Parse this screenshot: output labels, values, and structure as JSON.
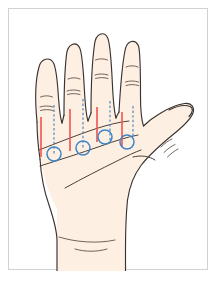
{
  "figure": {
    "frame_border_color": "#d2d2d2",
    "background_color": "#ffffff"
  },
  "colors": {
    "skin_fill": "#FDF0E3",
    "outline": "#3a3230",
    "crease": "#5a4a42",
    "measurement_line": "#ef5350",
    "guide_line": "#4a86c8",
    "marker": "#3f86c6"
  },
  "hand": {
    "view": "palmar",
    "side": "right",
    "parts": [
      {
        "name": "index-finger",
        "label": "Index finger"
      },
      {
        "name": "middle-finger",
        "label": "Middle finger"
      },
      {
        "name": "ring-finger",
        "label": "Ring finger"
      },
      {
        "name": "little-finger",
        "label": "Little finger"
      },
      {
        "name": "thumb",
        "label": "Thumb"
      },
      {
        "name": "palm",
        "label": "Palm"
      },
      {
        "name": "wrist",
        "label": "Wrist"
      }
    ]
  },
  "annotations": {
    "measurement_lines": {
      "count": 4,
      "style": "solid",
      "color": "#ef5350",
      "description": "Vertical red measurement lines over the distal palm"
    },
    "guide_lines": {
      "count": 4,
      "style": "dashed",
      "color": "#4a86c8",
      "description": "Vertical blue dashed guide lines in the web spaces"
    },
    "markers": {
      "count": 4,
      "shape": "circle",
      "color": "#3f86c6",
      "description": "Blue circle landmarks on the distal palmar crease"
    }
  },
  "chart_data": {
    "type": "scatter",
    "xlabel": "",
    "ylabel": "",
    "series": [
      {
        "name": "measurement-lines-red",
        "points": [
          {
            "x": 32,
            "y1": 108,
            "y2": 148
          },
          {
            "x": 61,
            "y1": 100,
            "y2": 142
          },
          {
            "x": 88,
            "y1": 98,
            "y2": 133
          },
          {
            "x": 113,
            "y1": 103,
            "y2": 138
          }
        ]
      },
      {
        "name": "guide-lines-blue-dashed",
        "points": [
          {
            "x": 45,
            "y1": 96,
            "y2": 146
          },
          {
            "x": 74,
            "y1": 90,
            "y2": 140
          },
          {
            "x": 101,
            "y1": 92,
            "y2": 134
          },
          {
            "x": 124,
            "y1": 97,
            "y2": 130
          }
        ]
      },
      {
        "name": "markers-blue-circles",
        "points": [
          {
            "x": 45,
            "y": 145,
            "r": 7
          },
          {
            "x": 74,
            "y": 139,
            "r": 7
          },
          {
            "x": 96,
            "y": 128,
            "r": 7
          },
          {
            "x": 118,
            "y": 133,
            "r": 7
          }
        ]
      }
    ],
    "grid": false,
    "legend": "none"
  }
}
